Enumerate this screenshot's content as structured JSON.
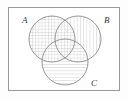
{
  "figure": {
    "type": "venn-diagram",
    "title": "",
    "universe": {
      "shape": "rectangle",
      "x": 8,
      "y": 7,
      "width": 112,
      "height": 84,
      "stroke": "#9a9a9a",
      "fill": "#ffffff"
    },
    "stroke_color": "#8c8c8c",
    "hatch_color": "#c2c2c2",
    "background": "#fdfdfd",
    "sets": [
      {
        "id": "A",
        "label": "A",
        "fill_pattern": "cross-hatch",
        "cx": 52,
        "cy": 39,
        "r": 23,
        "label_x": 22,
        "label_y": 20
      },
      {
        "id": "B",
        "label": "B",
        "fill_pattern": "vertical-lines",
        "cx": 78,
        "cy": 39,
        "r": 23,
        "label_x": 106,
        "label_y": 20
      },
      {
        "id": "C",
        "label": "C",
        "fill_pattern": "horizontal-lines",
        "cx": 65,
        "cy": 62,
        "r": 23,
        "label_x": 93,
        "label_y": 85
      }
    ]
  }
}
